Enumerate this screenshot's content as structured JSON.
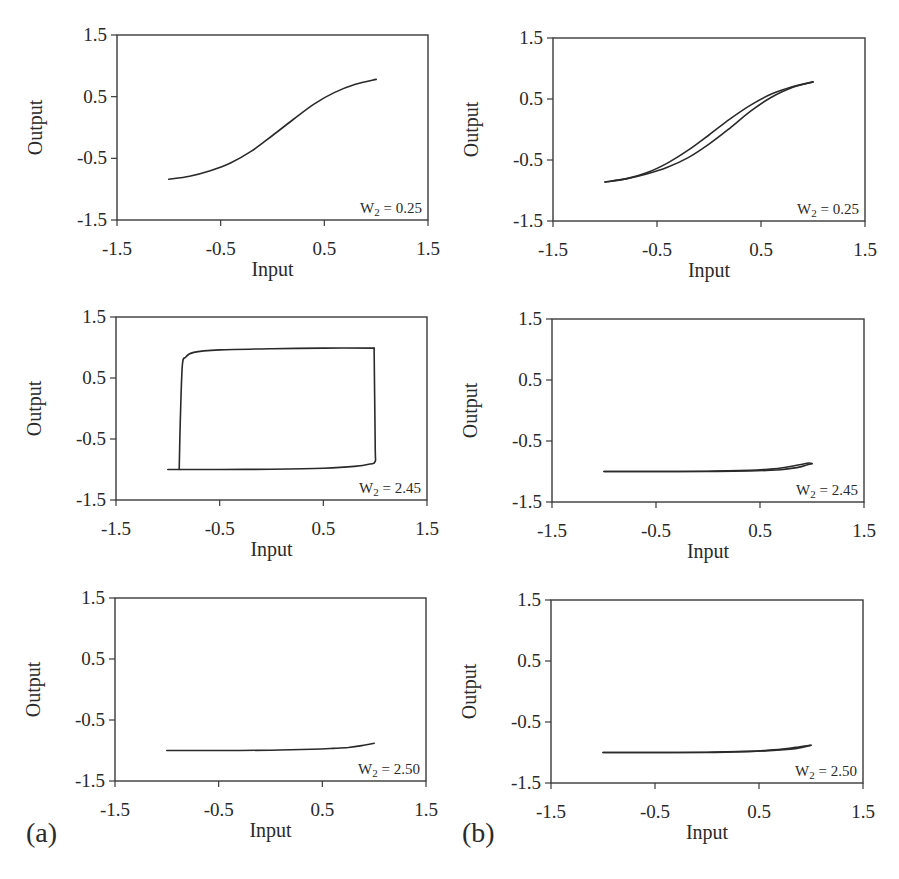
{
  "chart_data": [
    {
      "id": "a1",
      "group": "(a)",
      "type": "line",
      "xlabel": "Input",
      "ylabel": "Output",
      "xlim": [
        -1.5,
        1.5
      ],
      "ylim": [
        -1.5,
        1.5
      ],
      "xticks": [
        "-1.5",
        "-0.5",
        "0.5",
        "1.5"
      ],
      "yticks": [
        "1.5",
        "0.5",
        "-0.5",
        "-1.5"
      ],
      "annotation": {
        "W": "W",
        "sub": "2",
        "rest": " = 0.25"
      },
      "series": [
        {
          "name": "response",
          "x": [
            -1.0,
            -0.8,
            -0.6,
            -0.4,
            -0.2,
            0.0,
            0.2,
            0.4,
            0.6,
            0.8,
            1.0
          ],
          "y": [
            -0.84,
            -0.79,
            -0.7,
            -0.57,
            -0.38,
            -0.13,
            0.13,
            0.38,
            0.57,
            0.7,
            0.78
          ]
        }
      ],
      "box": {
        "left": 117,
        "top": 35,
        "right": 428,
        "bottom": 220
      }
    },
    {
      "id": "b1",
      "group": "(b)",
      "type": "line",
      "xlabel": "Input",
      "ylabel": "Output",
      "xlim": [
        -1.5,
        1.5
      ],
      "ylim": [
        -1.5,
        1.5
      ],
      "xticks": [
        "-1.5",
        "-0.5",
        "0.5",
        "1.5"
      ],
      "yticks": [
        "1.5",
        "0.5",
        "-0.5",
        "-1.5"
      ],
      "annotation": {
        "W": "W",
        "sub": "2",
        "rest": " = 0.25"
      },
      "series": [
        {
          "name": "increasing",
          "x": [
            -1.0,
            -0.8,
            -0.6,
            -0.4,
            -0.2,
            0.0,
            0.2,
            0.4,
            0.6,
            0.8,
            1.0
          ],
          "y": [
            -0.86,
            -0.81,
            -0.73,
            -0.62,
            -0.46,
            -0.24,
            0.02,
            0.3,
            0.53,
            0.69,
            0.78
          ]
        },
        {
          "name": "decreasing",
          "x": [
            1.0,
            0.8,
            0.6,
            0.4,
            0.2,
            0.0,
            -0.2,
            -0.4,
            -0.6,
            -0.8,
            -1.0
          ],
          "y": [
            0.78,
            0.7,
            0.58,
            0.4,
            0.17,
            -0.09,
            -0.34,
            -0.55,
            -0.71,
            -0.81,
            -0.86
          ]
        }
      ],
      "box": {
        "left": 553,
        "top": 38,
        "right": 865,
        "bottom": 221
      }
    },
    {
      "id": "a2",
      "group": "(a)",
      "type": "line",
      "xlabel": "Input",
      "ylabel": "Output",
      "xlim": [
        -1.5,
        1.5
      ],
      "ylim": [
        -1.5,
        1.5
      ],
      "xticks": [
        "-1.5",
        "-0.5",
        "0.5",
        "1.5"
      ],
      "yticks": [
        "1.5",
        "0.5",
        "-0.5",
        "-1.5"
      ],
      "annotation": {
        "W": "W",
        "sub": "2",
        "rest": " = 2.45"
      },
      "series": [
        {
          "name": "increasing",
          "x": [
            -1.0,
            -0.5,
            0.0,
            0.5,
            0.8,
            0.95,
            1.0,
            1.0,
            0.99
          ],
          "y": [
            -1.0,
            -1.0,
            -0.995,
            -0.98,
            -0.95,
            -0.91,
            -0.87,
            -0.6,
            0.99
          ]
        },
        {
          "name": "decreasing",
          "x": [
            0.99,
            0.5,
            0.0,
            -0.5,
            -0.75,
            -0.83,
            -0.86,
            -0.88,
            -0.89
          ],
          "y": [
            0.99,
            0.99,
            0.98,
            0.96,
            0.92,
            0.84,
            0.7,
            -0.2,
            -1.0
          ]
        }
      ],
      "box": {
        "left": 116,
        "top": 317,
        "right": 427,
        "bottom": 500
      }
    },
    {
      "id": "b2",
      "group": "(b)",
      "type": "line",
      "xlabel": "Input",
      "ylabel": "Output",
      "xlim": [
        -1.5,
        1.5
      ],
      "ylim": [
        -1.5,
        1.5
      ],
      "xticks": [
        "-1.5",
        "-0.5",
        "0.5",
        "1.5"
      ],
      "yticks": [
        "1.5",
        "0.5",
        "-0.5",
        "-1.5"
      ],
      "annotation": {
        "W": "W",
        "sub": "2",
        "rest": " = 2.45"
      },
      "series": [
        {
          "name": "increasing",
          "x": [
            -1.0,
            -0.5,
            0.0,
            0.4,
            0.6,
            0.75,
            0.88,
            0.97,
            1.0
          ],
          "y": [
            -1.0,
            -1.0,
            -0.995,
            -0.98,
            -0.96,
            -0.93,
            -0.89,
            -0.86,
            -0.87
          ]
        },
        {
          "name": "decreasing",
          "x": [
            1.0,
            0.9,
            0.8,
            0.7,
            0.6,
            0.4,
            0.0,
            -0.5,
            -1.0
          ],
          "y": [
            -0.87,
            -0.92,
            -0.95,
            -0.97,
            -0.98,
            -0.99,
            -1.0,
            -1.0,
            -1.0
          ]
        }
      ],
      "box": {
        "left": 552,
        "top": 319,
        "right": 864,
        "bottom": 502
      }
    },
    {
      "id": "a3",
      "group": "(a)",
      "type": "line",
      "xlabel": "Input",
      "ylabel": "Output",
      "xlim": [
        -1.5,
        1.5
      ],
      "ylim": [
        -1.5,
        1.5
      ],
      "xticks": [
        "-1.5",
        "-0.5",
        "0.5",
        "1.5"
      ],
      "yticks": [
        "1.5",
        "0.5",
        "-0.5",
        "-1.5"
      ],
      "annotation": {
        "W": "W",
        "sub": "2",
        "rest": " = 2.50"
      },
      "series": [
        {
          "name": "response",
          "x": [
            -1.0,
            -0.5,
            0.0,
            0.4,
            0.6,
            0.75,
            0.88,
            1.0
          ],
          "y": [
            -1.0,
            -1.0,
            -0.995,
            -0.98,
            -0.965,
            -0.95,
            -0.92,
            -0.88
          ]
        }
      ],
      "box": {
        "left": 115,
        "top": 598,
        "right": 426,
        "bottom": 781
      }
    },
    {
      "id": "b3",
      "group": "(b)",
      "type": "line",
      "xlabel": "Input",
      "ylabel": "Output",
      "xlim": [
        -1.5,
        1.5
      ],
      "ylim": [
        -1.5,
        1.5
      ],
      "xticks": [
        "-1.5",
        "-0.5",
        "0.5",
        "1.5"
      ],
      "yticks": [
        "1.5",
        "0.5",
        "-0.5",
        "-1.5"
      ],
      "annotation": {
        "W": "W",
        "sub": "2",
        "rest": " = 2.50"
      },
      "series": [
        {
          "name": "increasing",
          "x": [
            -1.0,
            -0.5,
            0.0,
            0.4,
            0.6,
            0.75,
            0.88,
            1.0
          ],
          "y": [
            -1.0,
            -1.0,
            -0.995,
            -0.98,
            -0.96,
            -0.94,
            -0.91,
            -0.88
          ]
        },
        {
          "name": "decreasing",
          "x": [
            1.0,
            0.9,
            0.8,
            0.6,
            0.4,
            0.0,
            -0.5,
            -1.0
          ],
          "y": [
            -0.88,
            -0.92,
            -0.945,
            -0.97,
            -0.985,
            -1.0,
            -1.0,
            -1.0
          ]
        }
      ],
      "box": {
        "left": 551,
        "top": 600,
        "right": 863,
        "bottom": 783
      }
    }
  ],
  "labels": {
    "panel_a": "(a)",
    "panel_b": "(b)"
  }
}
